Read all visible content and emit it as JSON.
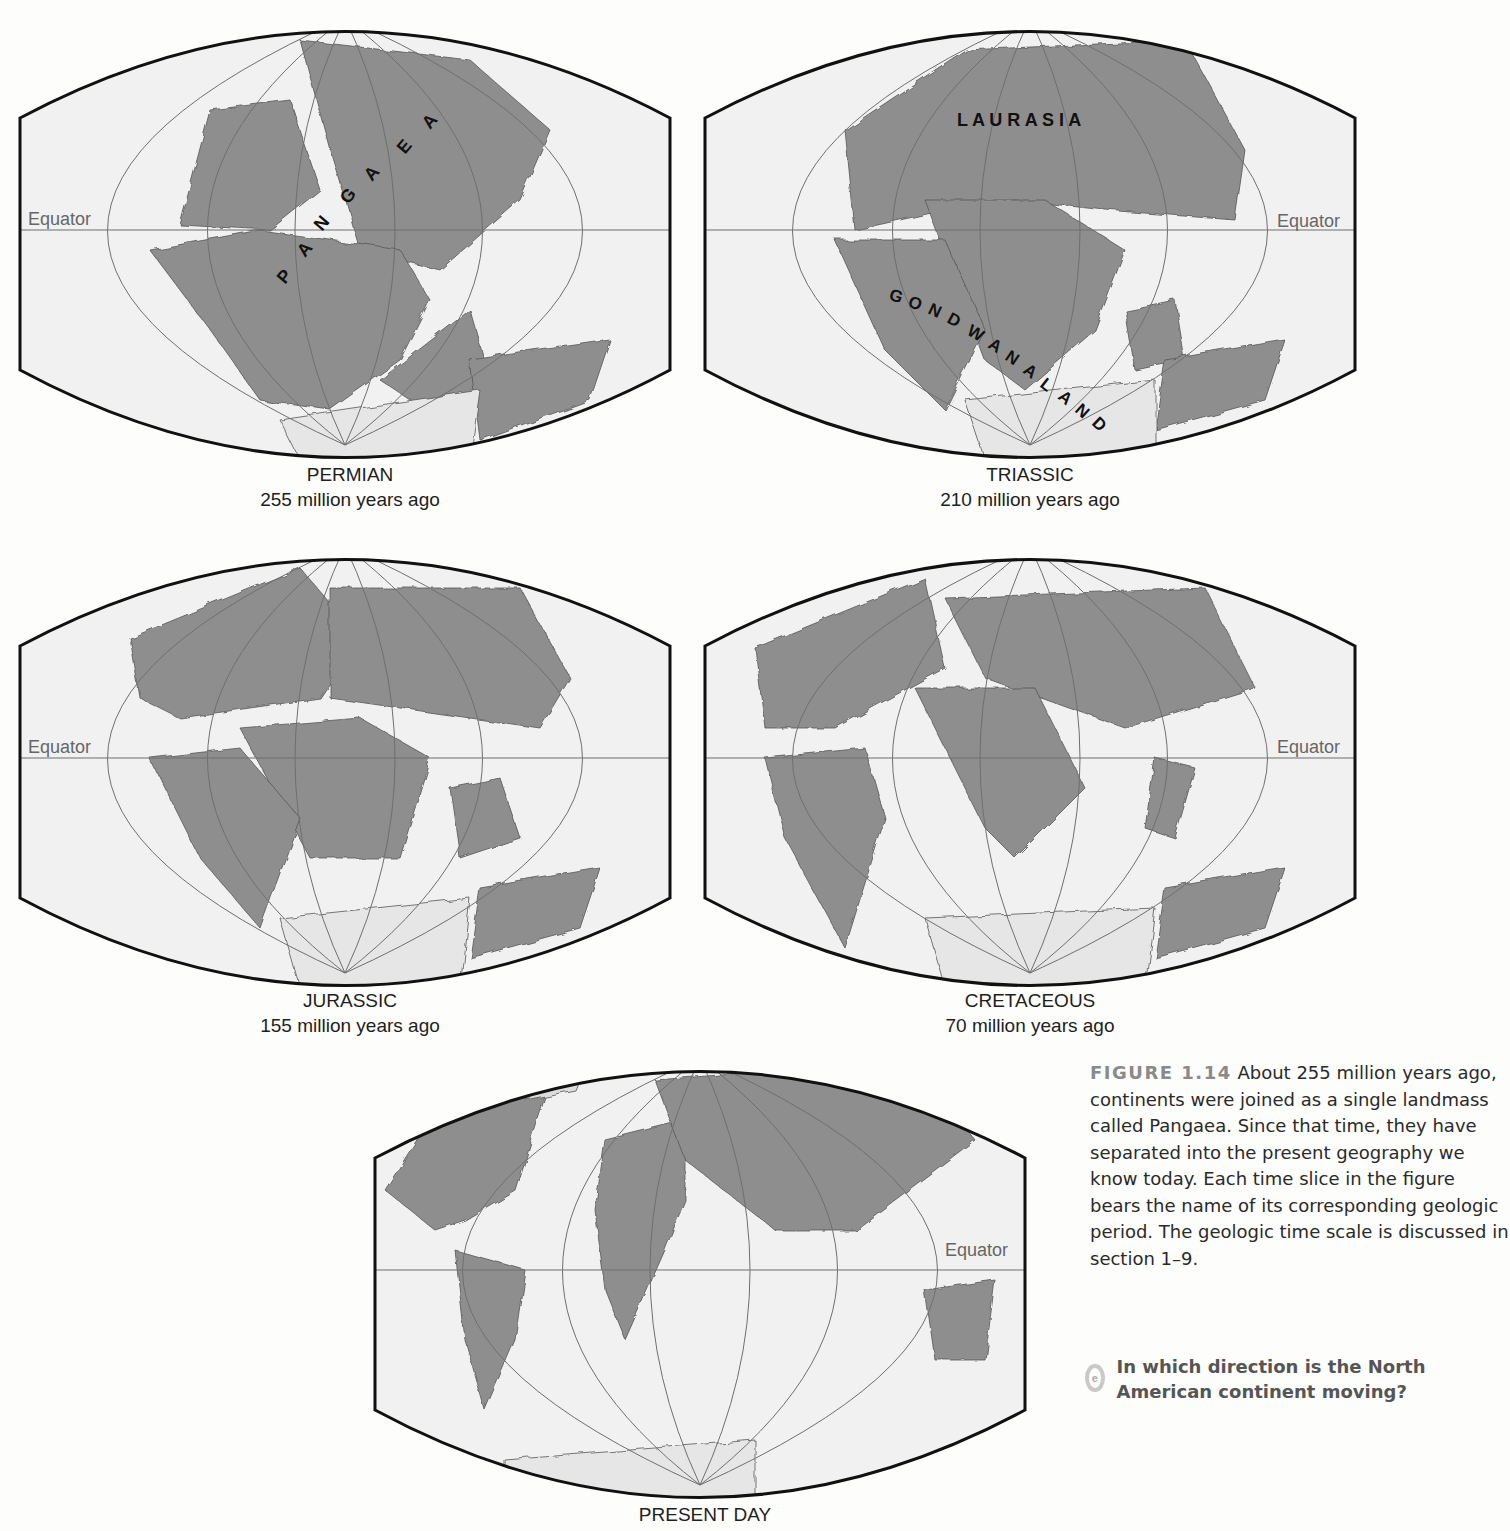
{
  "maps": [
    {
      "id": "permian",
      "period": "PERMIAN",
      "age": "255 million years ago",
      "equator_label": "Equator",
      "equator_side": "left",
      "labels": [
        "PANGAEA"
      ]
    },
    {
      "id": "triassic",
      "period": "TRIASSIC",
      "age": "210 million years ago",
      "equator_label": "Equator",
      "equator_side": "right",
      "labels": [
        "LAURASIA",
        "GONDWANALAND"
      ]
    },
    {
      "id": "jurassic",
      "period": "JURASSIC",
      "age": "155 million years ago",
      "equator_label": "Equator",
      "equator_side": "left",
      "labels": []
    },
    {
      "id": "cretaceous",
      "period": "CRETACEOUS",
      "age": "70 million years ago",
      "equator_label": "Equator",
      "equator_side": "right",
      "labels": []
    },
    {
      "id": "present",
      "period": "PRESENT DAY",
      "age": "",
      "equator_label": "Equator",
      "equator_side": "right",
      "labels": []
    }
  ],
  "map_text": {
    "pangaea_letters": [
      "P",
      "A",
      "N",
      "G",
      "A",
      "E",
      "A"
    ],
    "laurasia": "L A U R A S I A",
    "gondwanaland_letters": [
      "G",
      "O",
      "N",
      "D",
      "W",
      "A",
      "N",
      "A",
      "L",
      "A",
      "N",
      "D"
    ]
  },
  "caption": {
    "figure_number": "FIGURE 1.14",
    "text": "About 255 million years ago, continents were joined as a single landmass called Pangaea. Since that time, they have separated into the present geography we know today. Each time slice in the figure bears the name of its corresponding geologic period. The geologic time scale is discussed in section 1–9."
  },
  "question": {
    "icon": "question-icon",
    "text": "In which direction is the North American continent moving?"
  },
  "colors": {
    "land": "#8e8e8e",
    "ocean": "#f1f1f1",
    "frame": "#111111",
    "grid": "#6f6f6f",
    "figure_number": "#8a8a8a",
    "question": "#555555"
  }
}
